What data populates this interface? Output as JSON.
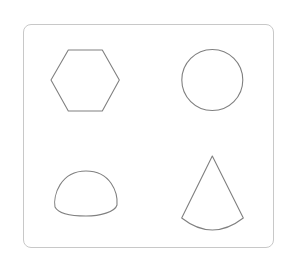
{
  "figure": {
    "stroke_color": "#808080",
    "frame_color": "#c8c8c8",
    "shapes": [
      {
        "name": "hexagon",
        "position": "top-left"
      },
      {
        "name": "circle",
        "position": "top-right"
      },
      {
        "name": "hemisphere",
        "position": "bottom-left"
      },
      {
        "name": "cone",
        "position": "bottom-right"
      }
    ]
  }
}
